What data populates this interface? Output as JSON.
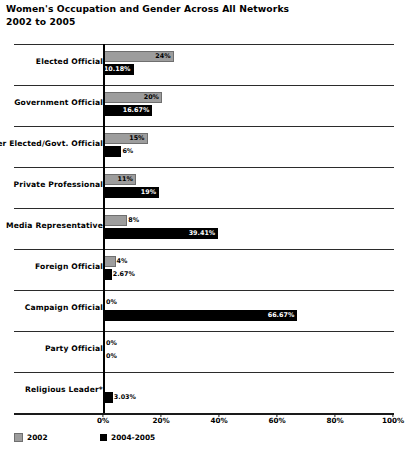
{
  "header": {
    "title": "Women's Occupation and Gender Across All Networks",
    "subtitle": "2002 to 2005"
  },
  "legend": {
    "items": [
      {
        "label": "2002",
        "color": "#9d9d9d"
      },
      {
        "label": "2004-2005",
        "color": "#000000"
      }
    ]
  },
  "axis": {
    "ticks": [
      "0%",
      "20%",
      "40%",
      "60%",
      "80%",
      "100%"
    ]
  },
  "chart_data": {
    "type": "bar",
    "orientation": "horizontal",
    "title": "Women's Occupation and Gender Across All Networks",
    "subtitle": "2002 to 2005",
    "xlabel": "",
    "ylabel": "",
    "xlim": [
      0,
      100
    ],
    "grid": false,
    "legend_position": "bottom-left",
    "categories": [
      "Elected Official",
      "Government Official",
      "Former Elected/Govt. Official",
      "Private Professional",
      "Media Representative",
      "Foreign Official",
      "Campaign Official",
      "Party Official",
      "Religious Leader*"
    ],
    "series": [
      {
        "name": "2002",
        "color": "#9d9d9d",
        "values": [
          24,
          20,
          15,
          11,
          8,
          4,
          0,
          0,
          0
        ],
        "labels": [
          "24%",
          "20%",
          "15%",
          "11%",
          "8%",
          "4%",
          "0%",
          "0%",
          ""
        ]
      },
      {
        "name": "2004-2005",
        "color": "#000000",
        "values": [
          10.18,
          16.67,
          6,
          19,
          39.41,
          2.67,
          66.67,
          0,
          3.03
        ],
        "labels": [
          "10.18%",
          "16.67%",
          "6%",
          "19%",
          "39.41%",
          "2.67%",
          "66.67%",
          "0%",
          "3.03%"
        ]
      }
    ]
  }
}
